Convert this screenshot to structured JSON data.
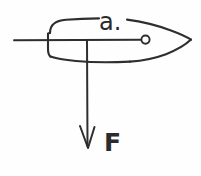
{
  "figure": {
    "kind": "hand-drawn-physics-diagram",
    "background_color": "#fefefe",
    "ink_color": "#2e2e2e",
    "width_px": 201,
    "height_px": 176
  },
  "labels": {
    "distance_label": "a.",
    "force_label": "F"
  },
  "annotations": {
    "pivot_marker": "open-circle",
    "arrow_direction": "down",
    "arrow_head_style": "open-v"
  },
  "geometry": {
    "hull": {
      "stern_x": 48,
      "bow_tip_x": 191,
      "top_y": 20,
      "bottom_y": 61,
      "centerline_y": 40
    },
    "axis_line": {
      "x_start": 14,
      "x_end": 143,
      "y": 40
    },
    "pivot_circle": {
      "cx": 145,
      "cy": 40,
      "r": 4
    },
    "force_arrow": {
      "x": 87,
      "y_start": 40,
      "y_end": 148
    },
    "label_positions": {
      "distance_label_x": 99,
      "distance_label_y": 10,
      "force_label_x": 104,
      "force_label_y": 130
    }
  }
}
